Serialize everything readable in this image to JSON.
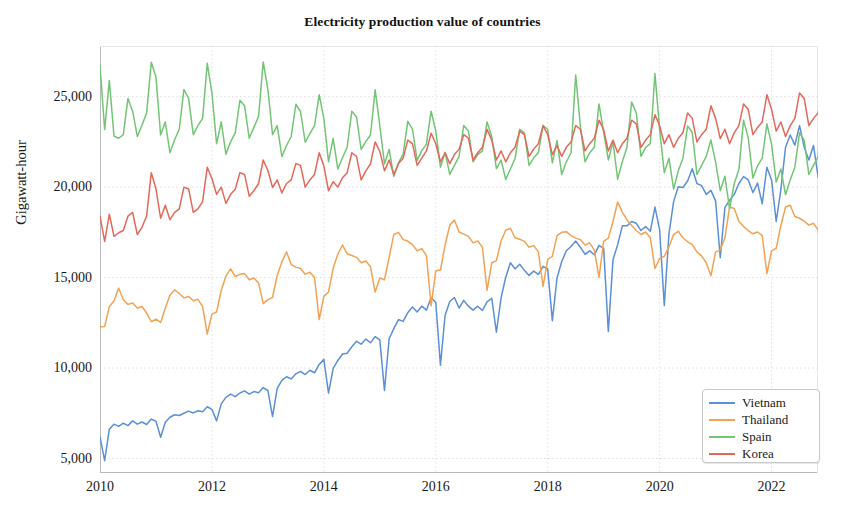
{
  "chart_data": {
    "type": "line",
    "title": "Electricity production value of countries",
    "xlabel": "",
    "ylabel": "Gigawatt-hour",
    "xlim": [
      2010.0,
      2022.83
    ],
    "ylim": [
      4200,
      27800
    ],
    "grid": true,
    "legend_position": "lower-right",
    "x_tick_labels": [
      "2010",
      "2012",
      "2014",
      "2016",
      "2018",
      "2020",
      "2022"
    ],
    "x_tick_values": [
      2010,
      2012,
      2014,
      2016,
      2018,
      2020,
      2022
    ],
    "y_tick_labels": [
      "5,000",
      "10,000",
      "15,000",
      "20,000",
      "25,000"
    ],
    "y_tick_values": [
      5000,
      10000,
      15000,
      20000,
      25000
    ],
    "x_start": 2010.0,
    "x_step": 0.08333333,
    "x_unit": "month",
    "colors": {
      "vietnam": "#5B8FD6",
      "thailand": "#F2A254",
      "spain": "#74C476",
      "korea": "#E2685C",
      "grid": "#dedede",
      "axis": "#b9b9b9",
      "background": "#ffffff"
    },
    "series": [
      {
        "name": "Vietnam",
        "color": "#5B8FD6",
        "values": [
          6200,
          4880,
          6620,
          6900,
          6780,
          6950,
          6820,
          7080,
          6900,
          7020,
          6880,
          7180,
          7060,
          6180,
          7000,
          7280,
          7420,
          7380,
          7500,
          7620,
          7520,
          7640,
          7580,
          7860,
          7720,
          7080,
          8020,
          8380,
          8560,
          8420,
          8620,
          8740,
          8560,
          8700,
          8640,
          8920,
          8760,
          7320,
          8880,
          9320,
          9520,
          9400,
          9680,
          9820,
          9640,
          9880,
          9740,
          10200,
          10480,
          8620,
          9980,
          10420,
          10780,
          10820,
          11180,
          11480,
          11320,
          11600,
          11400,
          11740,
          11560,
          8760,
          11620,
          12180,
          12680,
          12580,
          13060,
          13380,
          13100,
          13420,
          13200,
          13900,
          13620,
          10160,
          12920,
          13680,
          13900,
          13320,
          13740,
          13420,
          13200,
          13420,
          13180,
          13660,
          13860,
          11980,
          13880,
          15020,
          15820,
          15480,
          15740,
          15400,
          15120,
          15360,
          15180,
          15620,
          15480,
          12620,
          14980,
          15880,
          16480,
          16720,
          17020,
          16680,
          16280,
          16480,
          16260,
          16780,
          16620,
          12020,
          15980,
          16820,
          17860,
          17860,
          18100,
          18000,
          17600,
          17820,
          17560,
          18900,
          17640,
          13460,
          17420,
          19200,
          20020,
          19980,
          20340,
          21020,
          20200,
          20080,
          19600,
          19820,
          19240,
          16100,
          18880,
          19260,
          19600,
          20200,
          20580,
          20400,
          19700,
          20220,
          19080,
          21100,
          20400,
          18100,
          19880,
          22200,
          22880,
          22320,
          23400,
          22200,
          21500,
          22300,
          20540,
          22300,
          21200,
          18200,
          21080,
          22700,
          24320,
          23800,
          23100,
          22100,
          21420,
          20420
        ]
      },
      {
        "name": "Thailand",
        "color": "#F2A254",
        "values": [
          12280,
          12300,
          13400,
          13700,
          14420,
          13780,
          13520,
          13600,
          13320,
          13400,
          13040,
          12560,
          12700,
          12520,
          13300,
          14040,
          14320,
          14120,
          13880,
          13960,
          13720,
          13800,
          13400,
          11880,
          12980,
          13100,
          14300,
          15080,
          15480,
          15060,
          15180,
          15220,
          14880,
          14980,
          14700,
          13560,
          13780,
          13900,
          15120,
          15880,
          16420,
          15720,
          15580,
          15500,
          15180,
          15300,
          15020,
          12680,
          13960,
          14200,
          15520,
          16300,
          16800,
          16320,
          16220,
          16120,
          15820,
          15920,
          15600,
          14200,
          14980,
          14880,
          16120,
          17380,
          17500,
          17100,
          17020,
          16820,
          16480,
          16600,
          16220,
          13440,
          15380,
          15420,
          16800,
          17900,
          18180,
          17520,
          17400,
          17280,
          16920,
          17020,
          16680,
          14300,
          15820,
          15940,
          17020,
          17620,
          17720,
          17200,
          17120,
          17000,
          16680,
          16780,
          16420,
          14520,
          16000,
          16180,
          17320,
          17500,
          17540,
          17320,
          17180,
          17100,
          16800,
          16920,
          16520,
          15000,
          17000,
          17180,
          18100,
          19180,
          18620,
          18200,
          17880,
          17600,
          17380,
          17520,
          17200,
          15500,
          16060,
          16180,
          16700,
          17380,
          17560,
          17200,
          16980,
          16820,
          16420,
          16200,
          15820,
          15100,
          16420,
          16520,
          17200,
          18900,
          18820,
          18120,
          17820,
          17600,
          17420,
          17520,
          17320,
          15220,
          16480,
          16620,
          17880,
          18900,
          19000,
          18380,
          18280,
          18120,
          17900,
          18000,
          17620,
          15480,
          16620,
          16900,
          17800,
          18880,
          18880,
          18320,
          18120,
          17920,
          17180,
          15920
        ]
      },
      {
        "name": "Spain",
        "color": "#74C476",
        "values": [
          26700,
          23180,
          25900,
          22820,
          22700,
          22900,
          24900,
          24200,
          22800,
          23420,
          24100,
          26900,
          26080,
          22880,
          23600,
          21900,
          22620,
          23200,
          25400,
          24900,
          22900,
          23400,
          23800,
          26840,
          25200,
          22400,
          23600,
          21820,
          22500,
          23000,
          24800,
          24500,
          22700,
          23300,
          23900,
          26920,
          25400,
          22900,
          23400,
          21680,
          22300,
          22800,
          24580,
          24180,
          22480,
          22960,
          23400,
          25100,
          23800,
          21400,
          22700,
          21000,
          21620,
          22200,
          24200,
          23880,
          22080,
          22520,
          22880,
          25380,
          23400,
          21280,
          22080,
          20600,
          21340,
          21820,
          23640,
          23200,
          21480,
          22020,
          22380,
          24200,
          23100,
          21100,
          21920,
          20700,
          21200,
          21700,
          23400,
          23100,
          21400,
          21800,
          22000,
          23600,
          22800,
          21020,
          21500,
          20420,
          21000,
          21580,
          23200,
          23000,
          21200,
          21620,
          21900,
          23400,
          23200,
          21340,
          22580,
          20700,
          21400,
          21900,
          26200,
          23380,
          21400,
          21900,
          22200,
          24600,
          23020,
          21500,
          22500,
          20440,
          21400,
          22200,
          24700,
          24100,
          21700,
          22200,
          22400,
          26280,
          23180,
          20800,
          21600,
          19900,
          20900,
          21600,
          23380,
          23020,
          20700,
          21200,
          21700,
          22600,
          21400,
          19800,
          20600,
          18800,
          20200,
          20980,
          23700,
          22720,
          20500,
          21180,
          21600,
          23500,
          22380,
          20280,
          21000,
          19580,
          20400,
          21100,
          23000,
          22600,
          20700,
          21200,
          21700,
          26500,
          23500,
          21500,
          22200,
          20300,
          21500,
          22200,
          24200,
          23200,
          21000,
          21900
        ]
      },
      {
        "name": "Korea",
        "color": "#E2685C",
        "values": [
          18400,
          17000,
          18500,
          17280,
          17480,
          17600,
          18400,
          18600,
          17380,
          17780,
          18400,
          20800,
          19900,
          18280,
          19000,
          18200,
          18600,
          18800,
          20000,
          19900,
          18600,
          18800,
          19200,
          21100,
          20480,
          19600,
          20000,
          19100,
          19600,
          19880,
          20800,
          20700,
          19500,
          19800,
          20200,
          21500,
          20920,
          19980,
          20400,
          19680,
          20200,
          20400,
          21300,
          21200,
          20000,
          20400,
          20700,
          21900,
          21180,
          19800,
          20300,
          20000,
          20520,
          20800,
          21900,
          21700,
          20400,
          20900,
          21280,
          22500,
          21980,
          20900,
          21500,
          20700,
          21300,
          21600,
          22600,
          22400,
          21200,
          21600,
          22000,
          22980,
          22400,
          21400,
          21900,
          21300,
          21800,
          22100,
          22900,
          22700,
          21500,
          21900,
          22200,
          23200,
          22600,
          21500,
          22000,
          21400,
          21900,
          22200,
          23100,
          22900,
          21700,
          22100,
          22400,
          23400,
          22900,
          21800,
          22300,
          21700,
          22200,
          22500,
          23400,
          23200,
          22000,
          22400,
          22700,
          23700,
          23180,
          22000,
          22600,
          21900,
          22400,
          22700,
          23700,
          23500,
          22200,
          22600,
          22900,
          24000,
          23400,
          22400,
          22900,
          22200,
          22700,
          23000,
          24100,
          23800,
          22500,
          22900,
          23200,
          24500,
          23800,
          22680,
          23200,
          22400,
          23000,
          23400,
          24600,
          24300,
          22900,
          23300,
          23600,
          25100,
          24300,
          23100,
          23600,
          22800,
          23400,
          23800,
          25200,
          24900,
          23400,
          23800,
          24100,
          25700,
          24900,
          23500,
          24100,
          23280,
          23900,
          24400,
          24600,
          23000,
          23100,
          24400
        ]
      }
    ]
  },
  "legend": {
    "items": [
      {
        "label": "Vietnam",
        "color": "#5B8FD6"
      },
      {
        "label": "Thailand",
        "color": "#F2A254"
      },
      {
        "label": "Spain",
        "color": "#74C476"
      },
      {
        "label": "Korea",
        "color": "#E2685C"
      }
    ]
  }
}
